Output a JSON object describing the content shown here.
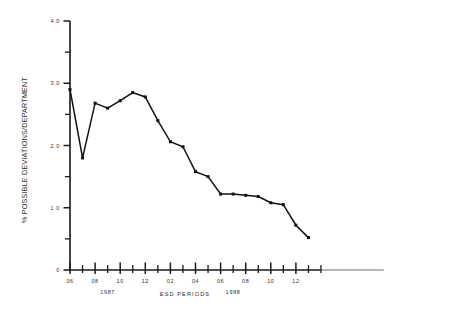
{
  "chart_data": {
    "type": "line",
    "title": "",
    "xlabel": "ESD PERIODS",
    "ylabel": "% POSSIBLE DEVIATIONS/DEPARTMENT",
    "ylim": [
      0,
      4.0
    ],
    "grid": false,
    "legend": null,
    "y_ticks_major": [
      "0",
      "1.0",
      "2.0",
      "3.0",
      "4.0"
    ],
    "y_tick_values_major": [
      0,
      1.0,
      2.0,
      3.0,
      4.0
    ],
    "y_tick_values_minor": [
      0.5,
      1.5,
      2.5,
      3.5
    ],
    "x_period_labels": [
      "06",
      "08",
      "10",
      "12",
      "02",
      "04",
      "06",
      "08",
      "10",
      "12"
    ],
    "x_period_label_values": [
      6,
      8,
      10,
      12,
      14,
      16,
      18,
      20,
      22,
      24
    ],
    "year_groups": [
      {
        "label": "1987",
        "value": 9
      },
      {
        "label": "1988",
        "value": 19
      }
    ],
    "x_tick_values": [
      6,
      7,
      8,
      9,
      10,
      11,
      12,
      13,
      14,
      15,
      16,
      17,
      18,
      19,
      20,
      21,
      22,
      23,
      24,
      25,
      26
    ],
    "x_range": [
      6,
      31
    ],
    "series": [
      {
        "name": "% possible deviations per department",
        "x": [
          6,
          7,
          8,
          9,
          10,
          11,
          12,
          13,
          14,
          15,
          16,
          17,
          18,
          19,
          20,
          21,
          22,
          23,
          24,
          25
        ],
        "values": [
          2.9,
          1.8,
          2.68,
          2.6,
          2.72,
          2.85,
          2.78,
          2.4,
          2.06,
          1.98,
          1.58,
          1.5,
          1.22,
          1.22,
          1.2,
          1.18,
          1.08,
          1.05,
          0.72,
          0.52
        ]
      }
    ]
  },
  "axis_text": {
    "y_title": "% POSSIBLE DEVIATIONS/DEPARTMENT",
    "x_title": "ESD PERIODS"
  }
}
